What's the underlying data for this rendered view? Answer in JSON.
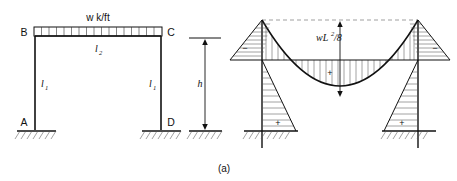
{
  "figure": {
    "caption": "(a)",
    "type": "structural-engineering-diagram"
  },
  "frame": {
    "joints": [
      {
        "name": "B",
        "label": "B"
      },
      {
        "name": "C",
        "label": "C"
      },
      {
        "name": "A",
        "label": "A"
      },
      {
        "name": "D",
        "label": "D"
      }
    ],
    "load_label": "w k/ft",
    "beam_label": "l",
    "beam_label_sub": "2",
    "left_column_label": "l",
    "left_column_label_sub": "1",
    "right_column_label": "l",
    "right_column_label_sub": "1",
    "height_label": "h",
    "support_type": "fixed"
  },
  "moment_diagram": {
    "midspan_label": "wL",
    "midspan_label_sup": "2",
    "midspan_label_tail": "/8",
    "regions": [
      {
        "name": "left-column-upper",
        "sign": "−"
      },
      {
        "name": "left-column-lower",
        "sign": "+"
      },
      {
        "name": "beam-midspan",
        "sign": "+"
      },
      {
        "name": "right-column-upper",
        "sign": "−"
      },
      {
        "name": "right-column-lower",
        "sign": "+"
      }
    ]
  },
  "colors": {
    "ink": "#111111",
    "hatch": "#555555",
    "dashed": "#777777",
    "background": "#ffffff"
  }
}
